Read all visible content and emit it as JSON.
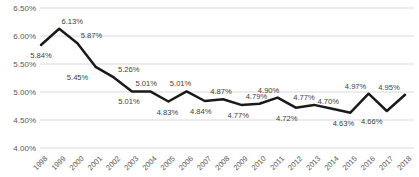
{
  "chart_data": {
    "type": "line",
    "title": "",
    "xlabel": "",
    "ylabel": "",
    "legend": false,
    "grid": true,
    "x": [
      "1998",
      "1999",
      "2000",
      "2001",
      "2002",
      "2003",
      "2004",
      "2005",
      "2006",
      "2007",
      "2008",
      "2009",
      "2010",
      "2011",
      "2012",
      "2013",
      "2014",
      "2015",
      "2016",
      "2017",
      "2018"
    ],
    "series": [
      {
        "name": "rate",
        "values": [
          5.84,
          6.13,
          5.87,
          5.45,
          5.26,
          5.01,
          5.01,
          4.83,
          5.01,
          4.84,
          4.87,
          4.77,
          4.79,
          4.9,
          4.72,
          4.77,
          4.7,
          4.63,
          4.97,
          4.66,
          4.95
        ]
      }
    ],
    "data_labels": [
      {
        "text": "5.84%",
        "pos": "below",
        "dx": 0
      },
      {
        "text": "6.13%",
        "pos": "above",
        "dx": 13
      },
      {
        "text": "5.87%",
        "pos": "above",
        "dx": 14
      },
      {
        "text": "5.45%",
        "pos": "below",
        "dx": -18
      },
      {
        "text": "5.26%",
        "pos": "above",
        "dx": 15
      },
      {
        "text": "5.01%",
        "pos": "below",
        "dx": -3
      },
      {
        "text": "5.01%",
        "pos": "above",
        "dx": -4
      },
      {
        "text": "4.83%",
        "pos": "below",
        "dx": -1
      },
      {
        "text": "5.01%",
        "pos": "above",
        "dx": -6
      },
      {
        "text": "4.84%",
        "pos": "below",
        "dx": -4
      },
      {
        "text": "4.87%",
        "pos": "above",
        "dx": -2
      },
      {
        "text": "4.77%",
        "pos": "below",
        "dx": -3
      },
      {
        "text": "4.79%",
        "pos": "above",
        "dx": -3
      },
      {
        "text": "4.90%",
        "pos": "above",
        "dx": -9
      },
      {
        "text": "4.72%",
        "pos": "below",
        "dx": -9
      },
      {
        "text": "4.77%",
        "pos": "above",
        "dx": -10
      },
      {
        "text": "4.70%",
        "pos": "above",
        "dx": -4
      },
      {
        "text": "4.63%",
        "pos": "below",
        "dx": -7
      },
      {
        "text": "4.97%",
        "pos": "above",
        "dx": -13
      },
      {
        "text": "4.66%",
        "pos": "below",
        "dx": -15
      },
      {
        "text": "4.95%",
        "pos": "above",
        "dx": -16
      }
    ],
    "y_axis": {
      "min": 4.0,
      "max": 6.5,
      "step": 0.5,
      "tick_labels": [
        "6.50%",
        "6.00%",
        "5.50%",
        "5.00%",
        "4.50%",
        "4.00%"
      ]
    },
    "colors": {
      "line": "#1a1a1a",
      "data_label": "#404040",
      "axis_label": "#595959",
      "gridline": "#d9d9d9",
      "background": "#ffffff"
    }
  }
}
